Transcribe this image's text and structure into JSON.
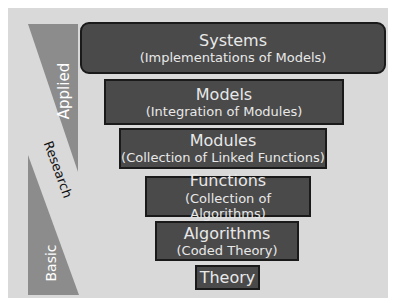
{
  "diagram": {
    "type": "inverted-pyramid",
    "levels": [
      {
        "title": "Systems",
        "subtitle": "(Implementations of Models)"
      },
      {
        "title": "Models",
        "subtitle": "(Integration of Modules)"
      },
      {
        "title": "Modules",
        "subtitle": "(Collection of Linked Functions)"
      },
      {
        "title": "Functions",
        "subtitle": "(Collection of Algorithms)"
      },
      {
        "title": "Algorithms",
        "subtitle": "(Coded Theory)"
      },
      {
        "title": "Theory",
        "subtitle": ""
      }
    ],
    "side_labels": {
      "applied": "Applied",
      "research": "Research",
      "basic": "Basic"
    },
    "colors": {
      "background": "#d9d9d9",
      "box_fill": "#4a4a4a",
      "box_border": "#1a1a1a",
      "box_text": "#e8e8e8",
      "triangle_fill": "#8c8c8c"
    }
  }
}
